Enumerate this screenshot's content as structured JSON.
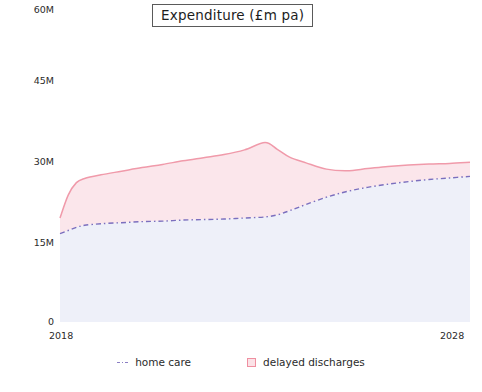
{
  "chart": {
    "title": "Expenditure (£m pa)",
    "y_axis_caption_cut": "£",
    "y_ticks": [
      "0",
      "15M",
      "30M",
      "45M",
      "60M"
    ],
    "x_tick_start": "2018",
    "x_tick_end": "2028",
    "legend": [
      {
        "label": "home care",
        "marker": "dotted-line-marker",
        "color": "#8b7fc4"
      },
      {
        "label": "delayed discharges",
        "marker": "square-marker",
        "color": "#ef8fa0"
      }
    ],
    "colors": {
      "home_care_line": "#7b6fbe",
      "home_care_fill": "#eef0f9",
      "delayed_discharges_line": "#f09aaa",
      "delayed_discharges_fill": "#fbe6eb",
      "background": "#ffffff",
      "text": "#2b2b2b",
      "gridline": "#e7ebf5"
    }
  },
  "chart_data": {
    "type": "area",
    "stacked": true,
    "title": "Expenditure (£m pa)",
    "xlabel": "",
    "ylabel": "£",
    "xlim": [
      2018,
      2028
    ],
    "ylim": [
      0,
      60
    ],
    "yticks": [
      0,
      15,
      30,
      45,
      60
    ],
    "ytick_labels": [
      "0",
      "15M",
      "30M",
      "45M",
      "60M"
    ],
    "xticks": [
      2018,
      2028
    ],
    "xtick_labels": [
      "2018",
      "2028"
    ],
    "grid": false,
    "legend_position": "bottom",
    "x": [
      2018,
      2018.2,
      2018.4,
      2018.6,
      2019,
      2019.5,
      2020,
      2020.5,
      2021,
      2021.5,
      2022,
      2022.5,
      2023,
      2023.3,
      2023.6,
      2024,
      2024.5,
      2025,
      2025.5,
      2026,
      2026.5,
      2027,
      2027.5,
      2028
    ],
    "series": [
      {
        "name": "home care",
        "values": [
          17.0,
          17.6,
          18.2,
          18.6,
          18.9,
          19.1,
          19.3,
          19.4,
          19.6,
          19.7,
          19.8,
          20.0,
          20.2,
          20.6,
          21.4,
          22.6,
          24.0,
          25.1,
          25.9,
          26.5,
          27.0,
          27.4,
          27.7,
          28.0
        ]
      },
      {
        "name": "delayed discharges",
        "values": [
          3.0,
          6.8,
          8.6,
          9.0,
          9.4,
          9.9,
          10.4,
          10.9,
          11.4,
          11.9,
          12.4,
          13.1,
          14.3,
          12.6,
          10.3,
          8.0,
          5.4,
          4.0,
          3.6,
          3.4,
          3.2,
          3.0,
          2.8,
          2.7
        ]
      }
    ],
    "cumulative_top": [
      20.0,
      24.4,
      26.8,
      27.6,
      28.3,
      29.0,
      29.7,
      30.3,
      31.0,
      31.6,
      32.2,
      33.1,
      34.5,
      33.2,
      31.7,
      30.6,
      29.4,
      29.1,
      29.5,
      29.9,
      30.2,
      30.4,
      30.5,
      30.7
    ]
  }
}
